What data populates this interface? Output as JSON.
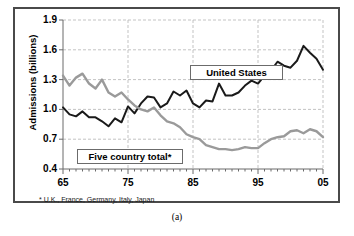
{
  "figure": {
    "caption": "(a)",
    "footnote": "* U.K., France, Germany, Italy, Japan"
  },
  "axis": {
    "y_title": "Admissions (billions)",
    "y_ticks": [
      "1.9",
      "1.6",
      "1.3",
      "1.0",
      "0.7",
      "0.4"
    ],
    "x_ticks": [
      "65",
      "75",
      "85",
      "95",
      "05"
    ]
  },
  "legend": {
    "series_us": "United States",
    "series_five": "Five country total*"
  },
  "colors": {
    "united_states": "#1a1a1a",
    "five_country_total": "#9a9a9a",
    "grid": "#b4b4b4",
    "axis": "#6b6b6b",
    "frame": "#4a4a4a"
  },
  "chart_data": {
    "type": "line",
    "title": "",
    "xlabel": "",
    "ylabel": "Admissions (billions)",
    "xlim": [
      1965,
      2005
    ],
    "ylim": [
      0.4,
      1.9
    ],
    "yticks": [
      0.4,
      0.7,
      1.0,
      1.3,
      1.6,
      1.9
    ],
    "xticks": [
      1965,
      1975,
      1985,
      1995,
      2005
    ],
    "grid": true,
    "grid_style": "dashed",
    "legend_position": "inside",
    "x": [
      1965,
      1966,
      1967,
      1968,
      1969,
      1970,
      1971,
      1972,
      1973,
      1974,
      1975,
      1976,
      1977,
      1978,
      1979,
      1980,
      1981,
      1982,
      1983,
      1984,
      1985,
      1986,
      1987,
      1988,
      1989,
      1990,
      1991,
      1992,
      1993,
      1994,
      1995,
      1996,
      1997,
      1998,
      1999,
      2000,
      2001,
      2002,
      2003,
      2004,
      2005
    ],
    "series": [
      {
        "name": "United States",
        "color": "#1a1a1a",
        "values": [
          1.02,
          0.95,
          0.93,
          0.98,
          0.92,
          0.92,
          0.88,
          0.83,
          0.91,
          0.87,
          1.03,
          0.96,
          1.06,
          1.13,
          1.12,
          1.02,
          1.06,
          1.18,
          1.14,
          1.19,
          1.06,
          1.02,
          1.09,
          1.08,
          1.26,
          1.14,
          1.14,
          1.17,
          1.24,
          1.29,
          1.26,
          1.34,
          1.39,
          1.48,
          1.44,
          1.42,
          1.49,
          1.64,
          1.57,
          1.51,
          1.4
        ]
      },
      {
        "name": "Five country total*",
        "color": "#9a9a9a",
        "values": [
          1.34,
          1.24,
          1.32,
          1.36,
          1.26,
          1.21,
          1.3,
          1.17,
          1.13,
          1.17,
          1.1,
          1.04,
          1.0,
          0.98,
          1.02,
          0.94,
          0.88,
          0.86,
          0.82,
          0.75,
          0.72,
          0.7,
          0.64,
          0.62,
          0.6,
          0.6,
          0.59,
          0.6,
          0.62,
          0.61,
          0.61,
          0.66,
          0.7,
          0.72,
          0.73,
          0.78,
          0.79,
          0.76,
          0.8,
          0.78,
          0.72
        ]
      }
    ]
  }
}
